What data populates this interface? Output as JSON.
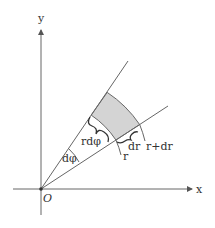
{
  "diagram": {
    "axes": {
      "x_label": "x",
      "y_label": "y",
      "origin_label": "O"
    },
    "labels": {
      "angle": "dφ",
      "arc_length": "rdφ",
      "radial_increment": "dr",
      "inner_radius": "r",
      "outer_radius": "r+dr"
    },
    "colors": {
      "line": "#555555",
      "shaded_region": "#d4d4d4",
      "text": "#333333"
    }
  }
}
